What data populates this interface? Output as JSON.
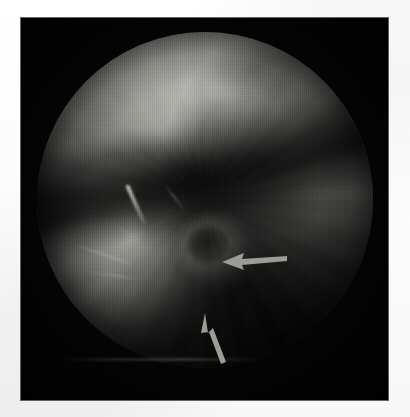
{
  "figure": {
    "kind": "endoscopic-photograph",
    "modality": "Endoscopy",
    "color_mode": "grayscale",
    "caption": "",
    "frame": {
      "background_color": "#050505",
      "x": 21,
      "y": 18,
      "width": 367,
      "height": 382
    },
    "page_background": "#ffffff",
    "field_of_view": {
      "shape": "circle",
      "center_x": 205,
      "center_y": 200,
      "radius": 168
    }
  },
  "regions": [
    {
      "id": "upper-mucosa",
      "label": "bright mucosal surface (upper field)",
      "tone": "#b0b0ab"
    },
    {
      "id": "shadow-fold",
      "label": "dark diagonal shadow fold across midfield",
      "tone": "#0d0d0d"
    },
    {
      "id": "left-lobe",
      "label": "illuminated mucosal lobe (lower left)",
      "tone": "#9c9c97"
    },
    {
      "id": "right-wall",
      "label": "receding lumen wall (right field)",
      "tone": "#5e5e5b"
    },
    {
      "id": "lesion",
      "label": "nodular lesion indicated by arrows",
      "tone": "#6a6a66"
    }
  ],
  "vessels": [
    {
      "id": "vessel-main",
      "label": "prominent linear vessel streak"
    },
    {
      "id": "vessel-a",
      "label": "branching submucosal vessel"
    },
    {
      "id": "vessel-b",
      "label": "branching submucosal vessel"
    },
    {
      "id": "vessel-c",
      "label": "fine vessel streak"
    },
    {
      "id": "vessel-d",
      "label": "fine vessel streak"
    }
  ],
  "annotations": {
    "arrow_color": "#9c9c96",
    "arrows": [
      {
        "id": "arrow-horizontal",
        "label": "arrow pointing left at lesion margin",
        "direction": "left",
        "tip_x": 222,
        "tip_y": 262,
        "tail_x": 287,
        "tail_y": 258
      },
      {
        "id": "arrow-oblique",
        "label": "arrow pointing up-left at lesion base",
        "direction": "up-left",
        "tip_x": 205,
        "tip_y": 313,
        "tail_x": 224,
        "tail_y": 362
      }
    ]
  }
}
